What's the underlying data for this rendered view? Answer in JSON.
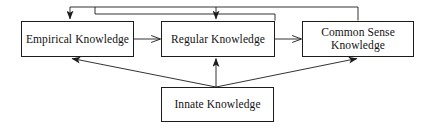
{
  "diagram": {
    "type": "flow-diagram",
    "stroke_color": "#1c1c1c",
    "text_color": "#121212",
    "background_color": "#ffffff",
    "nodes": [
      {
        "id": "empirical",
        "label": "Empirical Knowledge",
        "x": 21,
        "y": 21,
        "width": 113,
        "height": 36
      },
      {
        "id": "regular",
        "label": "Regular Knowledge",
        "x": 161,
        "y": 21,
        "width": 114,
        "height": 36
      },
      {
        "id": "common_sense",
        "label": "Common Sense\nKnowledge",
        "x": 302,
        "y": 21,
        "width": 112,
        "height": 36
      },
      {
        "id": "innate",
        "label": "Innate Knowledge",
        "x": 161,
        "y": 87,
        "width": 113,
        "height": 35
      }
    ],
    "edges": [
      {
        "id": "empirical-to-regular",
        "from": "empirical",
        "to": "regular",
        "style": "straight-horizontal",
        "arrow": "end"
      },
      {
        "id": "regular-to-common-sense",
        "from": "regular",
        "to": "common_sense",
        "style": "straight-horizontal",
        "arrow": "end"
      },
      {
        "id": "innate-to-empirical",
        "from": "innate",
        "to": "empirical",
        "style": "diagonal",
        "arrow": "end"
      },
      {
        "id": "innate-to-regular",
        "from": "innate",
        "to": "regular",
        "style": "straight-vertical",
        "arrow": "end"
      },
      {
        "id": "innate-to-common-sense",
        "from": "innate",
        "to": "common_sense",
        "style": "diagonal",
        "arrow": "end"
      },
      {
        "id": "common-sense-feedback-to-empirical",
        "from": "common_sense",
        "to": "empirical",
        "style": "orthogonal-top-loop",
        "arrow": "end"
      },
      {
        "id": "regular-feedback-to-empirical",
        "from": "regular",
        "to": "regular",
        "style": "orthogonal-top-loop",
        "arrow": "end"
      }
    ]
  }
}
